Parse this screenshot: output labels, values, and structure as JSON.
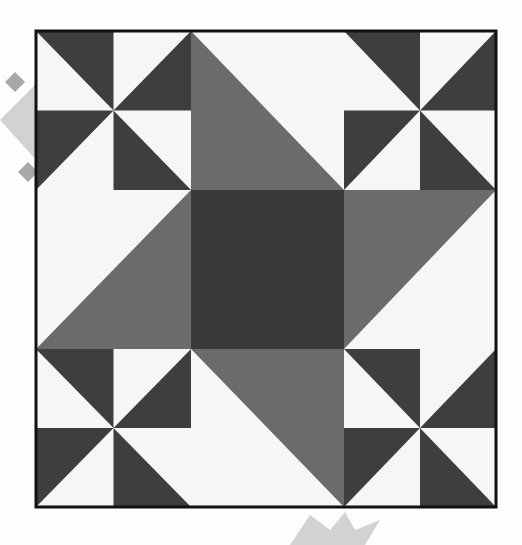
{
  "image": {
    "width": 522,
    "height": 545,
    "description": "Quilt block pattern: central dark square surrounded by four medium-gray right triangles, with four black-and-white pinwheel blocks in the corners"
  },
  "colors": {
    "page_background": "#fdfdfd",
    "fabric_light": "#f6f6f6",
    "fabric_dark": "#3e3e3e",
    "fabric_medium": "#6b6b6b",
    "center_square": "#3a3a3a",
    "frame_border": "#111111",
    "watermark": "#d2d2d2",
    "watermark_accent": "#a8a8a8"
  },
  "frame": {
    "x": 36,
    "y": 31,
    "width": 460,
    "height": 476,
    "stroke_width": 3
  },
  "grid": {
    "x": [
      36,
      113.5,
      191,
      344,
      420,
      496
    ],
    "y": [
      31,
      110.5,
      190,
      349,
      428,
      507
    ]
  },
  "blocks": {
    "center_square": {
      "x": 191,
      "y": 190,
      "width": 153,
      "height": 159
    },
    "medium_triangles": [
      {
        "name": "top",
        "points": "191,31 191,190 344,190"
      },
      {
        "name": "right",
        "points": "344,190 496,190 344,349"
      },
      {
        "name": "bottom",
        "points": "191,349 344,349 344,507"
      },
      {
        "name": "left",
        "points": "191,190 191,349 36,349"
      }
    ],
    "pinwheels": [
      {
        "name": "top-left",
        "triangles": [
          "36,31 113.5,31 113.5,110.5",
          "191,31 191,110.5 113.5,110.5",
          "36,110.5 113.5,110.5 36,190",
          "113.5,110.5 113.5,190 191,190"
        ]
      },
      {
        "name": "top-right",
        "triangles": [
          "344,31 420,31 420,110.5",
          "496,31 496,110.5 420,110.5",
          "344,110.5 420,110.5 344,190",
          "420,110.5 420,190 496,190"
        ]
      },
      {
        "name": "bottom-left",
        "triangles": [
          "36,349 113.5,349 113.5,428",
          "191,349 191,428 113.5,428",
          "36,428 113.5,428 36,507",
          "113.5,428 113.5,507 191,507"
        ]
      },
      {
        "name": "bottom-right",
        "triangles": [
          "344,349 420,349 420,428",
          "496,349 496,428 420,428",
          "344,428 420,428 344,507",
          "420,428 420,507 496,507"
        ]
      }
    ]
  },
  "watermarks": {
    "left_star": {
      "diamond": "0,120 38,82 60,120 38,162",
      "accents": [
        "5,82 15,72 25,82 15,92",
        "18,172 28,162 38,172 28,182"
      ]
    },
    "bottom_star": {
      "points": "290,545 310,515 330,530 345,512 355,530 380,520 365,545"
    }
  }
}
